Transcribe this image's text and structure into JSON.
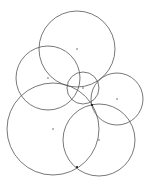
{
  "diagram": {
    "type": "circle-arrangement",
    "width": 150,
    "height": 184,
    "background": "#ffffff",
    "stroke_color": "#555555",
    "stroke_width": 0.8,
    "center_dot_color": "#444444",
    "circles": [
      {
        "id": "top",
        "cx": 77,
        "cy": 49,
        "r": 38
      },
      {
        "id": "upper-left",
        "cx": 48,
        "cy": 78,
        "r": 32
      },
      {
        "id": "small-center",
        "cx": 83,
        "cy": 88,
        "r": 16
      },
      {
        "id": "right",
        "cx": 117,
        "cy": 99,
        "r": 26
      },
      {
        "id": "lower-left-large",
        "cx": 53,
        "cy": 129,
        "r": 46
      },
      {
        "id": "lower-right",
        "cx": 99,
        "cy": 140,
        "r": 36
      }
    ],
    "intersection_points": [
      {
        "x": 92,
        "y": 105
      },
      {
        "x": 77,
        "y": 167
      }
    ]
  }
}
